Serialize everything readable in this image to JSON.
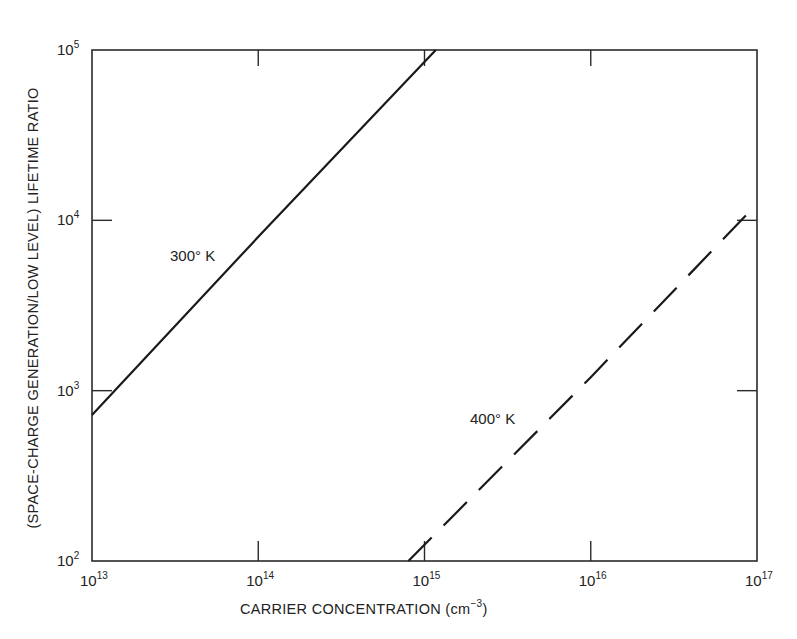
{
  "chart_data": {
    "type": "line",
    "title": "",
    "xlabel": "CARRIER CONCENTRATION (cm⁻³)",
    "xlabel_main": "CARRIER CONCENTRATION (cm",
    "xlabel_unit_sup": "−3",
    "xlabel_close": ")",
    "ylabel": "(SPACE-CHARGE GENERATION/LOW LEVEL) LIFETIME RATIO",
    "xscale": "log",
    "yscale": "log",
    "xlim": [
      10000000000000.0,
      1e+17
    ],
    "ylim": [
      100.0,
      100000.0
    ],
    "grid": false,
    "legend": "none (inline labels)",
    "x_ticks": [
      {
        "base": "10",
        "exp": "13",
        "value": 10000000000000.0
      },
      {
        "base": "10",
        "exp": "14",
        "value": 100000000000000.0
      },
      {
        "base": "10",
        "exp": "15",
        "value": 1000000000000000.0
      },
      {
        "base": "10",
        "exp": "16",
        "value": 1e+16
      },
      {
        "base": "10",
        "exp": "17",
        "value": 1e+17
      }
    ],
    "y_ticks": [
      {
        "base": "10",
        "exp": "2",
        "value": 100.0
      },
      {
        "base": "10",
        "exp": "3",
        "value": 1000.0
      },
      {
        "base": "10",
        "exp": "4",
        "value": 10000.0
      },
      {
        "base": "10",
        "exp": "5",
        "value": 100000.0
      }
    ],
    "series": [
      {
        "name": "300° K",
        "style": "solid",
        "x": [
          10000000000000.0,
          100000000000000.0,
          1170000000000000.0
        ],
        "y": [
          720,
          8000,
          100000.0
        ]
      },
      {
        "name": "400° K",
        "style": "dashed",
        "x": [
          800000000000000.0,
          1e+16,
          1e+17
        ],
        "y": [
          100.0,
          1200.0,
          12500.0
        ]
      }
    ],
    "annotations": [
      {
        "text": "300° K",
        "x": 22000000000000.0,
        "y": 5500
      },
      {
        "text": "400° K",
        "x": 1500000000000000.0,
        "y": 560
      }
    ]
  },
  "labels": {
    "series_300": "300° K",
    "series_400": "400° K"
  }
}
